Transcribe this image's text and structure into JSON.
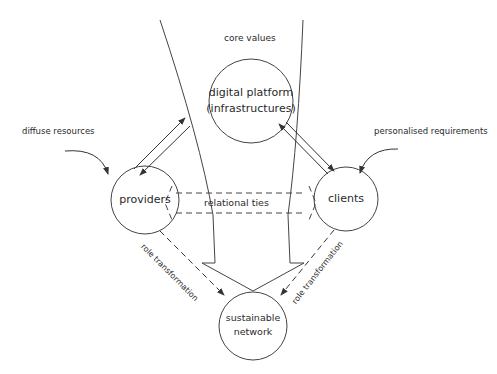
{
  "diagram": {
    "nodes": {
      "platform": {
        "line1": "digital platform",
        "line2": "(infrastructures)"
      },
      "providers": {
        "label": "providers"
      },
      "clients": {
        "label": "clients"
      },
      "network": {
        "line1": "sustainable",
        "line2": "network"
      }
    },
    "labels": {
      "core_values": "core values",
      "diffuse_resources": "diffuse resources",
      "personalised_requirements": "personalised requirements",
      "relational_ties": "relational ties",
      "role_transformation_left": "role transformation",
      "role_transformation_right": "role transformation"
    },
    "edges": [
      {
        "from": "providers",
        "to": "platform",
        "type": "bidirectional-arrows"
      },
      {
        "from": "clients",
        "to": "platform",
        "type": "bidirectional-arrows"
      },
      {
        "from": "providers",
        "to": "clients",
        "type": "dashed-double-arrow",
        "label": "relational ties"
      },
      {
        "from": "providers",
        "to": "network",
        "type": "dashed-arrow",
        "label": "role transformation"
      },
      {
        "from": "clients",
        "to": "network",
        "type": "dashed-arrow",
        "label": "role transformation"
      },
      {
        "from": "platform",
        "to": "network",
        "type": "funnel-hollow-arrow",
        "label": "core values"
      },
      {
        "from": "diffuse resources",
        "to": "providers",
        "type": "curved-arrow"
      },
      {
        "from": "personalised requirements",
        "to": "clients",
        "type": "curved-arrow"
      }
    ],
    "colors": {
      "stroke": "#333333",
      "text": "#2a2a2a",
      "background": "#ffffff"
    }
  }
}
